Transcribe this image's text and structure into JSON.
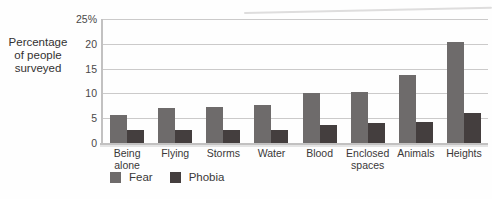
{
  "chart_data": {
    "type": "bar",
    "title": "",
    "ylabel": "Percentage\nof people\nsurveyed",
    "xlabel": "",
    "categories": [
      "Being alone",
      "Flying",
      "Storms",
      "Water",
      "Blood",
      "Enclosed spaces",
      "Animals",
      "Heights"
    ],
    "category_labels": [
      "Being\nalone",
      "Flying",
      "Storms",
      "Water",
      "Blood",
      "Enclosed\nspaces",
      "Animals",
      "Heights"
    ],
    "series": [
      {
        "name": "Fear",
        "color": "#6e6b6b",
        "values": [
          5.7,
          7.0,
          7.3,
          7.6,
          10.0,
          10.2,
          13.7,
          20.3
        ]
      },
      {
        "name": "Phobia",
        "color": "#443e3e",
        "values": [
          2.7,
          2.7,
          2.7,
          2.7,
          3.7,
          4.0,
          4.3,
          6.0
        ]
      }
    ],
    "ylim": [
      0,
      25
    ],
    "yticks": [
      {
        "value": 25,
        "label": "25%"
      },
      {
        "value": 20,
        "label": "20"
      },
      {
        "value": 15,
        "label": "15"
      },
      {
        "value": 10,
        "label": "10"
      },
      {
        "value": 5,
        "label": "5"
      },
      {
        "value": 0,
        "label": "0"
      }
    ],
    "grid": true,
    "legend_position": "bottom"
  },
  "colors": {
    "gridline": "#cbcaca",
    "axis": "#c2c1c1",
    "background": "#fefefe"
  }
}
